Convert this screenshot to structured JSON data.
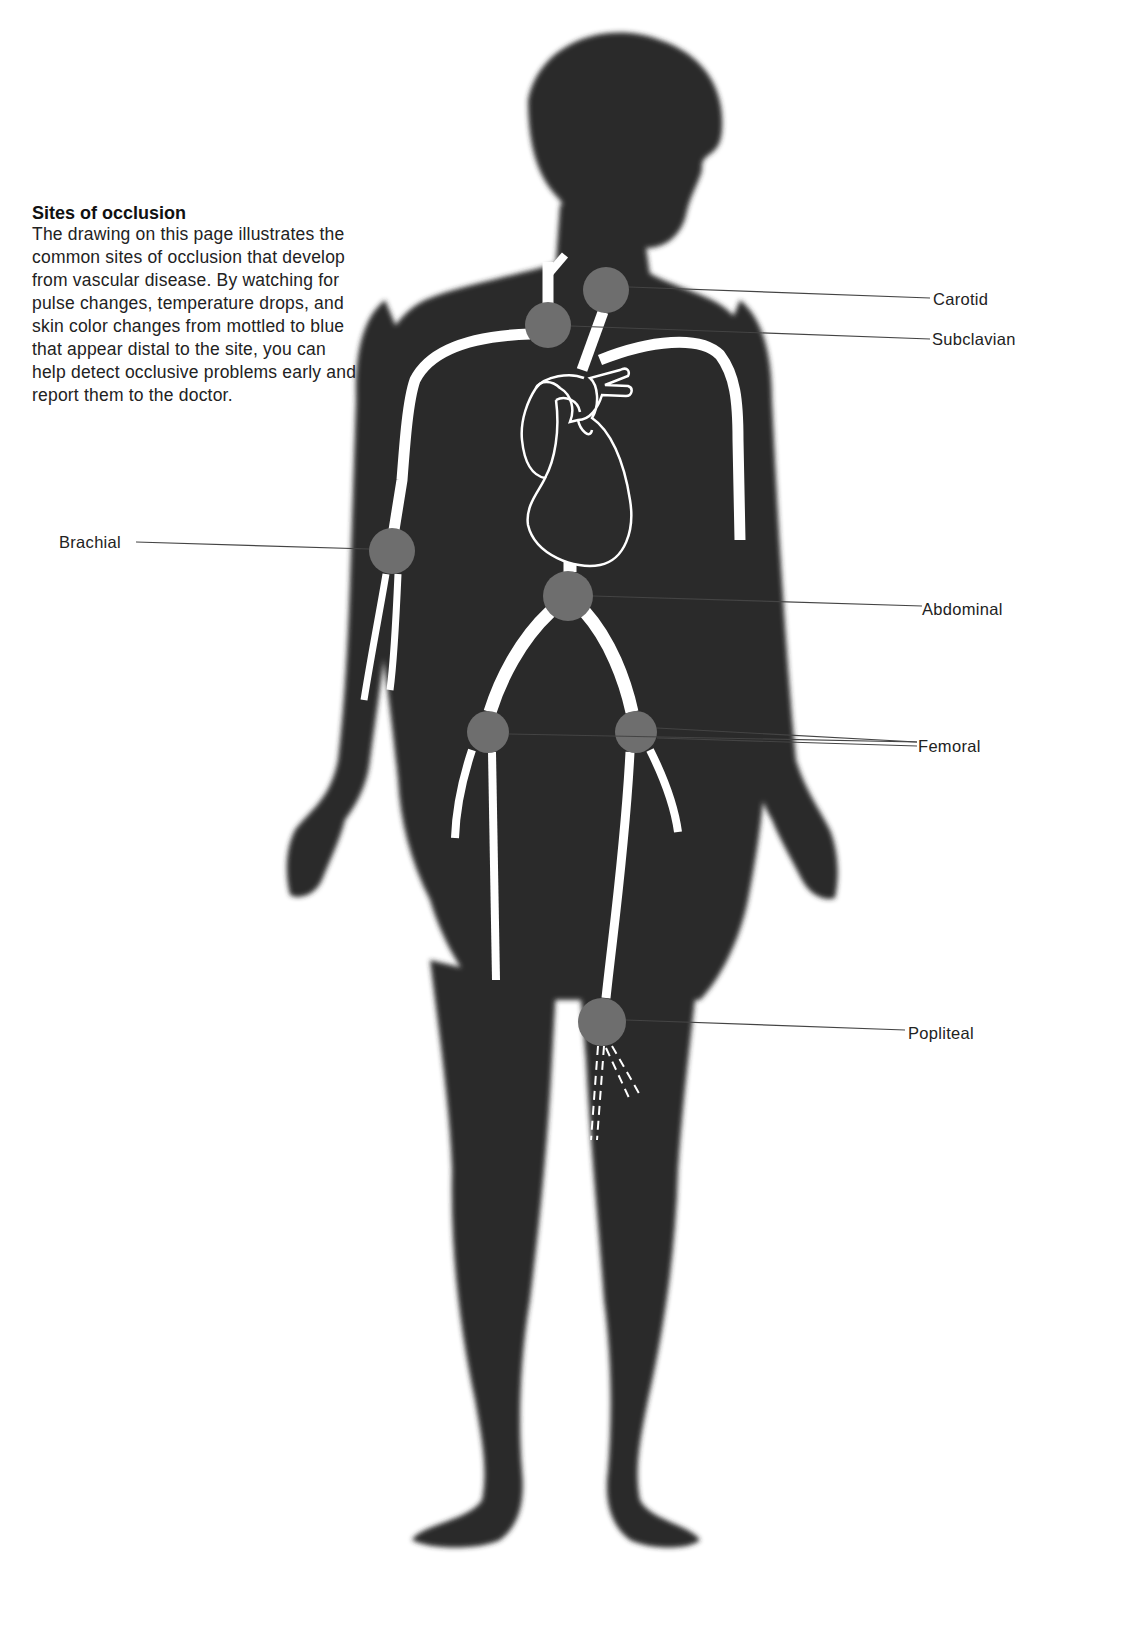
{
  "caption": {
    "title": "Sites of occlusion",
    "body": "The drawing on this page illustrates the common sites of occlusion that develop from vascular disease. By watching for pulse changes, temperature drops, and skin color changes from mottled to blue that appear distal to the site, you can help detect occlusive problems early and report them to the doctor."
  },
  "labels": {
    "carotid": "Carotid",
    "subclavian": "Subclavian",
    "brachial": "Brachial",
    "abdominal": "Abdominal",
    "femoral": "Femoral",
    "popliteal": "Popliteal"
  },
  "colors": {
    "silhouette": "#2b2b2b",
    "artery": "#ffffff",
    "occlusion_site": "#6e6e6e",
    "leader_line": "#333333",
    "background": "#ffffff"
  },
  "occlusion_sites": [
    {
      "name": "Carotid",
      "cx": 606,
      "cy": 290,
      "r": 23
    },
    {
      "name": "Subclavian",
      "cx": 548,
      "cy": 325,
      "r": 23
    },
    {
      "name": "Brachial",
      "cx": 392,
      "cy": 551,
      "r": 23
    },
    {
      "name": "Abdominal",
      "cx": 568,
      "cy": 596,
      "r": 25
    },
    {
      "name": "Femoral (right)",
      "cx": 488,
      "cy": 732,
      "r": 21
    },
    {
      "name": "Femoral (left)",
      "cx": 636,
      "cy": 732,
      "r": 21
    },
    {
      "name": "Popliteal",
      "cx": 602,
      "cy": 1022,
      "r": 24
    }
  ]
}
